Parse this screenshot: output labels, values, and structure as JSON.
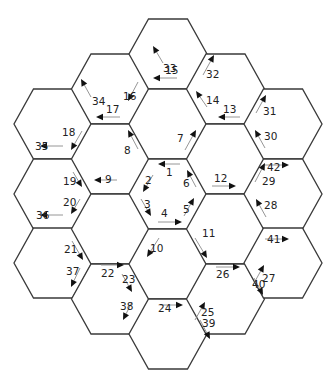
{
  "diagram": {
    "type": "hexagonal-board",
    "hex_count": 19,
    "colors": {
      "edge": "#3a3a3a",
      "arrow_shaft": "#8a8a8a",
      "arrow_head": "#111111",
      "label": "#222222"
    },
    "arrows": [
      {
        "label": "1",
        "hex": "center",
        "edge": "top",
        "direction": "left"
      },
      {
        "label": "2",
        "hex": "center",
        "edge": "upper-left",
        "direction": "down-left"
      },
      {
        "label": "3",
        "hex": "center",
        "edge": "lower-left",
        "direction": "down-right"
      },
      {
        "label": "4",
        "hex": "center",
        "edge": "bottom",
        "direction": "right"
      },
      {
        "label": "5",
        "hex": "center",
        "edge": "lower-right",
        "direction": "up-right"
      },
      {
        "label": "6",
        "hex": "center",
        "edge": "upper-right",
        "direction": "up-left"
      },
      {
        "label": "7",
        "hex": "inner-upper-right",
        "edge": "lower-left",
        "direction": "up-right"
      },
      {
        "label": "8",
        "hex": "inner-upper-left",
        "edge": "lower-right",
        "direction": "up-left"
      },
      {
        "label": "9",
        "hex": "inner-lower-left",
        "edge": "top",
        "direction": "left"
      },
      {
        "label": "10",
        "hex": "inner-bottom",
        "edge": "upper-left",
        "direction": "down-left"
      },
      {
        "label": "11",
        "hex": "inner-lower-right",
        "edge": "upper-left",
        "direction": "down-right"
      },
      {
        "label": "12",
        "hex": "inner-lower-right",
        "edge": "top",
        "direction": "right"
      },
      {
        "label": "13",
        "hex": "inner-upper-right",
        "edge": "top",
        "direction": "left"
      },
      {
        "label": "14",
        "hex": "inner-top",
        "edge": "lower-right",
        "direction": "up-left"
      },
      {
        "label": "15",
        "hex": "outer-top",
        "edge": "bottom",
        "direction": "left"
      },
      {
        "label": "16",
        "hex": "inner-top",
        "edge": "lower-left",
        "direction": "down-left"
      },
      {
        "label": "17",
        "hex": "inner-upper-left",
        "edge": "top",
        "direction": "left"
      },
      {
        "label": "18",
        "hex": "outer-left-top",
        "edge": "lower-right",
        "direction": "down-left"
      },
      {
        "label": "19",
        "hex": "outer-left-mid",
        "edge": "upper-right",
        "direction": "down-right"
      },
      {
        "label": "20",
        "hex": "outer-left-mid",
        "edge": "lower-right",
        "direction": "down-left"
      },
      {
        "label": "21",
        "hex": "outer-left-bottom",
        "edge": "upper-right",
        "direction": "down-right"
      },
      {
        "label": "22",
        "hex": "outer-lower-left",
        "edge": "top",
        "direction": "right"
      },
      {
        "label": "23",
        "hex": "outer-lower-left",
        "edge": "upper-right",
        "direction": "down-right"
      },
      {
        "label": "24",
        "hex": "outer-bottom",
        "edge": "top",
        "direction": "right"
      },
      {
        "label": "25",
        "hex": "outer-lower-right",
        "edge": "lower-left",
        "direction": "up-right"
      },
      {
        "label": "26",
        "hex": "outer-lower-right",
        "edge": "top",
        "direction": "right"
      },
      {
        "label": "27",
        "hex": "outer-right-bottom",
        "edge": "upper-left",
        "direction": "up-right"
      },
      {
        "label": "28",
        "hex": "outer-right-mid",
        "edge": "lower-left",
        "direction": "up-left"
      },
      {
        "label": "29",
        "hex": "outer-right-mid",
        "edge": "upper-left",
        "direction": "up-right"
      },
      {
        "label": "30",
        "hex": "outer-right-top",
        "edge": "lower-left",
        "direction": "up-left"
      },
      {
        "label": "31",
        "hex": "outer-right-top",
        "edge": "upper-left",
        "direction": "up-right"
      },
      {
        "label": "32",
        "hex": "outer-upper-right",
        "edge": "lower-left",
        "direction": "up-right"
      },
      {
        "label": "33",
        "hex": "outer-top",
        "edge": "lower-left",
        "direction": "up-left"
      },
      {
        "label": "34",
        "hex": "outer-upper-left",
        "edge": "lower-right",
        "direction": "up-left"
      },
      {
        "label": "35",
        "hex": "outer-left-top",
        "edge": "bottom",
        "direction": "left"
      },
      {
        "label": "36",
        "hex": "outer-left-mid",
        "edge": "bottom",
        "direction": "left"
      },
      {
        "label": "37",
        "hex": "outer-left-bottom",
        "edge": "lower-right",
        "direction": "down-left"
      },
      {
        "label": "38",
        "hex": "outer-lower-left",
        "edge": "lower-right",
        "direction": "down-left"
      },
      {
        "label": "39",
        "hex": "outer-bottom",
        "edge": "upper-left",
        "direction": "down-right"
      },
      {
        "label": "40",
        "hex": "outer-lower-right",
        "edge": "upper-right",
        "direction": "down-right"
      },
      {
        "label": "41",
        "hex": "outer-right-bottom",
        "edge": "top",
        "direction": "right"
      },
      {
        "label": "42",
        "hex": "outer-right-mid",
        "edge": "top",
        "direction": "right"
      }
    ]
  }
}
